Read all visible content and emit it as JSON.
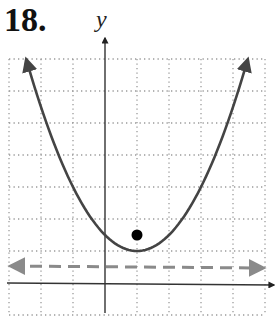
{
  "problem": {
    "number": "18."
  },
  "chart_data": {
    "type": "line",
    "title": "",
    "xlabel": "",
    "ylabel": "y",
    "xlim": [
      -3,
      5
    ],
    "ylim": [
      -1,
      7
    ],
    "grid": true,
    "grid_style": "dotted",
    "tick_labels": false,
    "series": [
      {
        "name": "parabola",
        "equation": "y = (x - 1)^2 / 2 + 1",
        "style": "solid",
        "color": "#444444",
        "arrows": "both ends",
        "vertex": [
          1,
          1
        ],
        "points": [
          [
            -2.46,
            7
          ],
          [
            -2,
            5.5
          ],
          [
            -1,
            3
          ],
          [
            0,
            1.5
          ],
          [
            1,
            1
          ],
          [
            2,
            1.5
          ],
          [
            3,
            3
          ],
          [
            4,
            5.5
          ],
          [
            4.46,
            7
          ]
        ]
      },
      {
        "name": "directrix",
        "equation": "y = 0.5",
        "style": "dashed",
        "color": "#888888",
        "arrows": "both ends",
        "points": [
          [
            -3,
            0.5
          ],
          [
            5,
            0.5
          ]
        ]
      }
    ],
    "annotations": [
      {
        "type": "point",
        "name": "focus",
        "x": 1,
        "y": 1.5,
        "color": "#000000"
      }
    ]
  },
  "render": {
    "origin_px": [
      105,
      283
    ],
    "unit_px": 32,
    "grid_color": "#9a9a9a",
    "axis_color": "#333333",
    "curve_color": "#444444",
    "directrix_color": "#888888",
    "focus_color": "#000000"
  }
}
